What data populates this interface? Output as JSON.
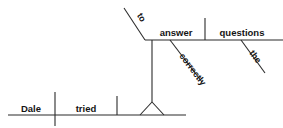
{
  "diagram": {
    "type": "reed-kellogg-sentence-diagram",
    "sentence": "Dale tried to answer the questions correctly.",
    "line_color": "#2b2b2b",
    "text_color": "#141414",
    "background": "#ffffff",
    "baseline": {
      "subject": "Dale",
      "verb": "tried",
      "subject_verb_divider": "|",
      "object_divider": "|"
    },
    "infinitive_phrase": {
      "particle": "to",
      "verb": "answer",
      "object": "questions",
      "object_divider": "|",
      "modifiers": {
        "adverb": "correctly",
        "article": "the"
      }
    },
    "words": {
      "dale": "Dale",
      "tried": "tried",
      "to": "to",
      "answer": "answer",
      "questions": "questions",
      "correctly": "correctly",
      "the": "the"
    }
  }
}
